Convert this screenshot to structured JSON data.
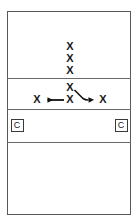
{
  "diagram": {
    "type": "court-play-diagram",
    "title": "",
    "court": {
      "outline": {
        "x": 7,
        "y": 11,
        "width": 124,
        "height": 204
      },
      "division_lines": [
        {
          "name": "attack-line-upper",
          "y": 78
        },
        {
          "name": "center-line",
          "y": 109
        },
        {
          "name": "attack-line-lower",
          "y": 142
        }
      ],
      "zones": [
        {
          "name": "back-zone-far",
          "label": ""
        },
        {
          "name": "front-zone-far",
          "label": ""
        },
        {
          "name": "front-zone-near",
          "label": ""
        },
        {
          "name": "back-zone-near",
          "label": ""
        }
      ]
    },
    "players": [
      {
        "name": "player-column-1",
        "label": "X",
        "x": 70,
        "y": 47
      },
      {
        "name": "player-column-2",
        "label": "X",
        "x": 70,
        "y": 59
      },
      {
        "name": "player-column-3",
        "label": "X",
        "x": 70,
        "y": 71
      },
      {
        "name": "player-setter",
        "label": "X",
        "x": 70,
        "y": 88
      },
      {
        "name": "player-center",
        "label": "X",
        "x": 70,
        "y": 100
      },
      {
        "name": "player-left-target",
        "label": "X",
        "x": 37,
        "y": 100
      },
      {
        "name": "player-right-target",
        "label": "X",
        "x": 103,
        "y": 100
      }
    ],
    "coaches": [
      {
        "name": "coach-left",
        "label": "C",
        "x": 17,
        "y": 125
      },
      {
        "name": "coach-right",
        "label": "C",
        "x": 121,
        "y": 125
      }
    ],
    "arrows": [
      {
        "name": "arrow-left-movement",
        "direction": "left",
        "from": {
          "x": 64,
          "y": 100
        },
        "to": {
          "x": 45,
          "y": 100
        },
        "style": "straight"
      },
      {
        "name": "arrow-right-movement",
        "direction": "right",
        "from": {
          "x": 74,
          "y": 90
        },
        "to": {
          "x": 96,
          "y": 100
        },
        "style": "diagonal-curve"
      }
    ],
    "colors": {
      "court_border": "#585858",
      "court_line": "#6a6a6a",
      "mark": "#1a1a1a",
      "arrow": "#111111",
      "background": "#ffffff"
    }
  }
}
